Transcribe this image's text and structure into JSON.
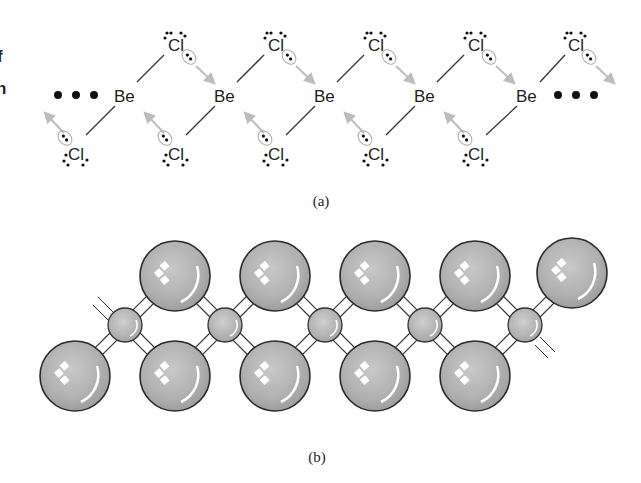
{
  "figure": {
    "edge_fragments": [
      "f",
      "n"
    ],
    "part_a": {
      "caption": "(a)",
      "central_atom": "Be",
      "bridging_atom": "Cl",
      "ellipsis": "• • •",
      "be_positions": [
        [
          125,
          95
        ],
        [
          225,
          95
        ],
        [
          325,
          95
        ],
        [
          425,
          95
        ],
        [
          527,
          95
        ]
      ],
      "cl_top_positions": [
        [
          175,
          45
        ],
        [
          275,
          45
        ],
        [
          375,
          45
        ],
        [
          475,
          45
        ],
        [
          575,
          45
        ]
      ],
      "cl_bottom_positions": [
        [
          75,
          148
        ],
        [
          175,
          148
        ],
        [
          275,
          148
        ],
        [
          375,
          148
        ],
        [
          475,
          148
        ]
      ]
    },
    "part_b": {
      "caption": "(b)",
      "large_sphere_label": "Cl",
      "small_sphere_label": "Be",
      "colors": {
        "sphere_fill": "#b3b3b3",
        "sphere_stroke": "#2a2a2a",
        "bond_fill": "#ffffff",
        "arrow": "#bdbdbd"
      }
    }
  }
}
